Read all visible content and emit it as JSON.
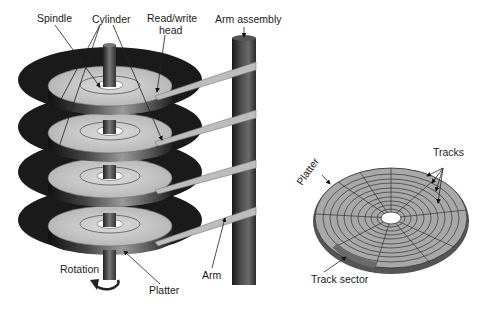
{
  "diagram": {
    "left": {
      "labels": {
        "spindle": "Spindle",
        "cylinder": "Cylinder",
        "read_write_head_line1": "Read/write",
        "read_write_head_line2": "head",
        "arm_assembly": "Arm assembly",
        "rotation": "Rotation",
        "platter": "Platter",
        "arm": "Arm"
      },
      "platter_count": 4
    },
    "right": {
      "labels": {
        "platter": "Platter",
        "tracks": "Tracks",
        "track_sector": "Track sector"
      },
      "track_rings": 10,
      "sector_count": 10
    },
    "colors": {
      "platter_surface": "#c9c9c9",
      "platter_dark": "#1c1c1c",
      "spindle": "#555555",
      "arm": "#bdbdbd",
      "column": "#3a3a3a",
      "text": "#1a1a1a"
    }
  }
}
